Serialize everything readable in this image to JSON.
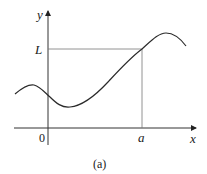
{
  "figure": {
    "caption": "(a)",
    "axes": {
      "x_label": "x",
      "y_label": "y",
      "origin_label": "0"
    },
    "annotations": {
      "limit_label": "L",
      "point_label": "a"
    },
    "colors": {
      "axis": "#333333",
      "curve": "#2a2a2a",
      "guide": "#777777"
    }
  }
}
